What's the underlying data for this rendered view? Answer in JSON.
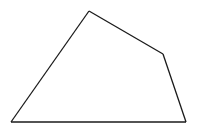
{
  "diagram": {
    "shape": "quadrilateral",
    "stroke_color": "#1a1a1a",
    "background_color": "#ffffff",
    "vertex_count": 4,
    "labels": []
  }
}
